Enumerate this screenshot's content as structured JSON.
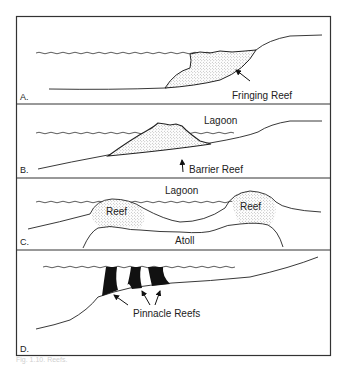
{
  "figure": {
    "caption": "Fig. 1.10. Reefs.",
    "colors": {
      "line": "#222222",
      "stipple": "#9a9a9a",
      "solid_reef": "#111111",
      "background": "#ffffff"
    },
    "panels": [
      {
        "id": "A",
        "label": "A.",
        "annotations": [
          "Fringing Reef"
        ]
      },
      {
        "id": "B",
        "label": "B.",
        "annotations": [
          "Lagoon",
          "Barrier Reef"
        ]
      },
      {
        "id": "C",
        "label": "C.",
        "annotations": [
          "Lagoon",
          "Reef",
          "Reef",
          "Atoll"
        ]
      },
      {
        "id": "D",
        "label": "D.",
        "annotations": [
          "Pinnacle Reefs"
        ]
      }
    ]
  }
}
